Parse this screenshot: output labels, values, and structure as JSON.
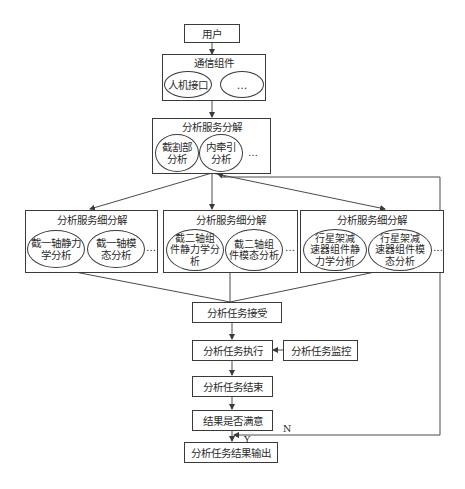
{
  "diagram": {
    "nodes": {
      "user": "用户",
      "comm": {
        "title": "通信组件",
        "items": [
          "人机接口",
          "…"
        ]
      },
      "decompose": {
        "title": "分析服务分解",
        "items": [
          "截割部\n分析",
          "内牵引\n分析"
        ],
        "more": "…"
      },
      "sub": [
        {
          "title": "分析服务细分解",
          "items": [
            "截一轴静力\n学分析",
            "截一轴模\n态分析"
          ],
          "more": "…"
        },
        {
          "title": "分析服务细分解",
          "items": [
            "截二轴组\n件静力学分\n析",
            "截二轴组\n件模态分析"
          ],
          "more": "…"
        },
        {
          "title": "分析服务细分解",
          "items": [
            "行星架减\n速器组件静\n力学分析",
            "行星架减\n速器组件模\n态分析"
          ],
          "more": "…"
        }
      ],
      "accept": "分析任务接受",
      "execute": "分析任务执行",
      "monitor": "分析任务监控",
      "finish": "分析任务结束",
      "satisfied": "结果是否满意",
      "output": "分析任务结果输出"
    },
    "edge_labels": {
      "no": "N",
      "yes": "Y"
    }
  }
}
